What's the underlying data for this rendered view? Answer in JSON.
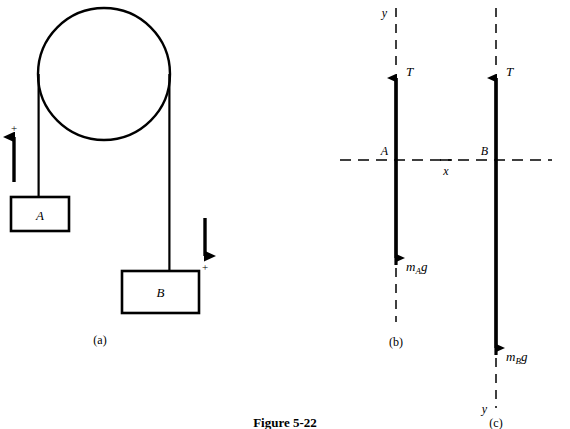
{
  "figure": {
    "caption": "Figure 5-22",
    "panels": [
      {
        "id": "a",
        "label": "(a)",
        "type": "physical-setup",
        "description": "Atwood machine: pulley with rope over it supporting block A on the left and block B on the right",
        "blocks": [
          {
            "name": "A",
            "label": "A",
            "side": "left"
          },
          {
            "name": "B",
            "label": "B",
            "side": "right"
          }
        ],
        "direction_markers": [
          {
            "label": "+",
            "arrow": "up",
            "side": "left"
          },
          {
            "label": "+",
            "arrow": "down",
            "side": "right"
          }
        ]
      },
      {
        "id": "b",
        "label": "(b)",
        "type": "free-body-diagram",
        "point_label": "A",
        "axis_y_label": "y",
        "axis_y_position": "top",
        "axis_x_label": "x",
        "forces": [
          {
            "label": "T",
            "direction": "up"
          },
          {
            "label": "m",
            "subscript": "A",
            "suffix": "g",
            "direction": "down"
          }
        ]
      },
      {
        "id": "c",
        "label": "(c)",
        "type": "free-body-diagram",
        "point_label": "B",
        "axis_y_label": "y",
        "axis_y_position": "bottom",
        "axis_x_label": "",
        "forces": [
          {
            "label": "T",
            "direction": "up"
          },
          {
            "label": "m",
            "subscript": "B",
            "suffix": "g",
            "direction": "down"
          }
        ]
      }
    ]
  },
  "colors": {
    "ink": "#000000",
    "background": "#ffffff"
  },
  "text": {
    "panel_a_label": "(a)",
    "panel_b_label": "(b)",
    "panel_c_label": "(c)",
    "block_a": "A",
    "block_b": "B",
    "plus_left": "+",
    "plus_right": "+",
    "b_point": "A",
    "b_axis_y": "y",
    "b_axis_x": "x",
    "b_tension": "T",
    "b_weight_m": "m",
    "b_weight_sub": "A",
    "b_weight_g": "g",
    "c_point": "B",
    "c_axis_y": "y",
    "c_tension": "T",
    "c_weight_m": "m",
    "c_weight_sub": "B",
    "c_weight_g": "g",
    "caption": "Figure 5-22"
  }
}
